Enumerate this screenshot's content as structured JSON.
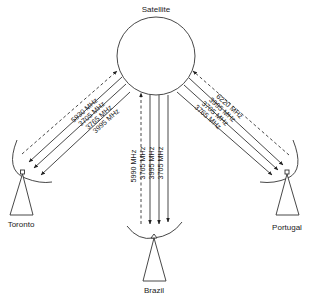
{
  "diagram": {
    "satellite": {
      "label": "Satellite"
    },
    "stations": {
      "toronto": {
        "label": "Toronto",
        "uplink": "5930 MHz",
        "downlinks": [
          "3705 MHz",
          "3765 MHz",
          "3995 MHz"
        ]
      },
      "brazil": {
        "label": "Brazil",
        "uplink": "5990 MHz",
        "downlinks": [
          "3765 MHz",
          "3995 MHz",
          "3705 MHz"
        ]
      },
      "portugal": {
        "label": "Portugal",
        "uplink": "6220 MHz",
        "downlinks": [
          "3995 MHz",
          "3705 MHz",
          "3765 MHz"
        ]
      }
    },
    "legend_semantics": {
      "dashed": "uplink (station to satellite)",
      "solid": "downlink (satellite to station)"
    }
  }
}
